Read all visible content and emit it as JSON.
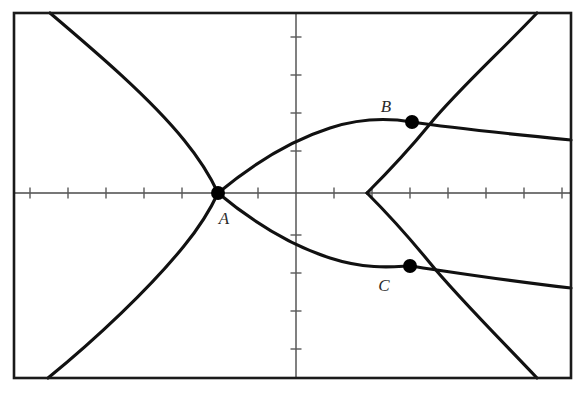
{
  "figure": {
    "background_color": "#ffffff",
    "frame": {
      "stroke_color": "#1a1a1a",
      "x": 14,
      "y": 13,
      "width": 557,
      "height": 365
    },
    "axes": {
      "x_axis_y": 193,
      "y_axis_x": 296,
      "axis_color": "#4a4a4a",
      "tick_color": "#5a5a5a",
      "tick_length": 11,
      "tick_spacing": 38,
      "x_ticks": [
        30,
        68,
        106,
        144,
        182,
        220,
        258,
        334,
        372,
        410,
        448,
        486,
        524,
        562
      ],
      "y_ticks": [
        37,
        75,
        113,
        151,
        235,
        273,
        311,
        349
      ]
    }
  },
  "chart_data": {
    "type": "line",
    "xlabel": "",
    "ylabel": "",
    "grid": false,
    "legend": false,
    "xlim": [
      14,
      571
    ],
    "ylim": [
      378,
      13
    ],
    "annotations": [
      {
        "label": "A",
        "x": 218,
        "y": 193,
        "label_dx": 6,
        "label_dy": 31,
        "marker": "filled-circle",
        "marker_radius": 7
      },
      {
        "label": "B",
        "x": 412,
        "y": 122,
        "label_dx": -26,
        "label_dy": -10,
        "marker": "filled-circle",
        "marker_radius": 7
      },
      {
        "label": "C",
        "x": 410,
        "y": 266,
        "label_dx": -26,
        "label_dy": 25,
        "marker": "filled-circle",
        "marker_radius": 7
      }
    ],
    "series": [
      {
        "name": "cubic-upper-branch",
        "description": "Upper branch of singular cubic descending from top-left to node at A",
        "path": "M 50 13 C 96 52, 150 98, 184 140 C 202 162, 212 180, 218 193"
      },
      {
        "name": "cubic-lower-branch",
        "description": "Lower branch of singular cubic from node at A down to bottom-left",
        "path": "M 218 193 C 212 206, 202 224, 184 246 C 150 288, 96 339, 48 378"
      },
      {
        "name": "cubic-upper-right-arc",
        "description": "Right upper arc of the cubic from node A rising through B and exiting top edge",
        "path": "M 218 193 C 248 168, 286 142, 330 128 C 370 115, 400 120, 412 122 C 452 128, 500 133, 571 140"
      },
      {
        "name": "cubic-lower-right-arc",
        "description": "Right lower arc of the cubic from node A falling through C and exiting right edge",
        "path": "M 218 193 C 248 218, 286 244, 330 258 C 370 271, 400 266, 410 266 C 452 272, 500 280, 571 288"
      },
      {
        "name": "second-curve-upper",
        "description": "Second curve: upper half of parabola-like branch opening right, vertex on x-axis, through B, exiting top edge",
        "path": "M 537 13 C 500 52, 456 92, 430 124 C 412 146, 390 170, 367 193"
      },
      {
        "name": "second-curve-lower",
        "description": "Second curve: lower half of parabola-like branch, through C, exiting bottom edge",
        "path": "M 367 193 C 390 216, 412 241, 430 263 C 456 295, 500 339, 537 378"
      }
    ]
  }
}
